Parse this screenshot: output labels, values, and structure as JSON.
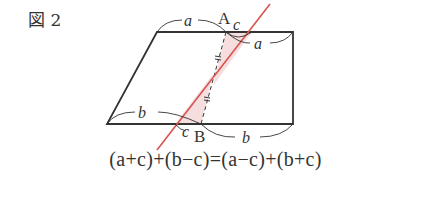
{
  "figure": {
    "label": "図 2",
    "points": {
      "A": "A",
      "B": "B"
    },
    "segment_labels": {
      "top_left": "a",
      "top_right": "a",
      "top_c": "c",
      "bottom_left": "b",
      "bottom_right": "b",
      "bottom_c": "c"
    },
    "tick_mark": "=",
    "colors": {
      "cut_line": "#d9534f",
      "shade": "#f6dede",
      "outline": "#333333"
    }
  },
  "formula": "(a+c)+(b−c)=(a−c)+(b+c)"
}
